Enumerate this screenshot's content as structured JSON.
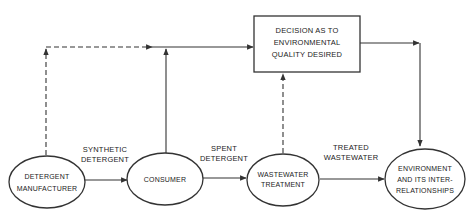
{
  "diagram": {
    "decision_box": {
      "lines": [
        "DECISION AS TO",
        "ENVIRONMENTAL",
        "QUALITY DESIRED"
      ]
    },
    "nodes": [
      {
        "id": "detergent-manufacturer",
        "lines": [
          "DETERGENT",
          "MANUFACTURER"
        ]
      },
      {
        "id": "consumer",
        "lines": [
          "CONSUMER"
        ]
      },
      {
        "id": "wastewater-treatment",
        "lines": [
          "WASTEWATER",
          "TREATMENT"
        ]
      },
      {
        "id": "environment",
        "lines": [
          "ENVIRONMENT",
          "AND ITS INTER-",
          "RELATIONSHIPS"
        ]
      }
    ],
    "edge_labels": {
      "synthetic_detergent": [
        "SYNTHETIC",
        "DETERGENT"
      ],
      "spent_detergent": [
        "SPENT",
        "DETERGENT"
      ],
      "treated_wastewater": [
        "TREATED",
        "WASTEWATER"
      ]
    },
    "colors": {
      "line": "#333333",
      "text": "#222222",
      "background": "#ffffff"
    }
  }
}
